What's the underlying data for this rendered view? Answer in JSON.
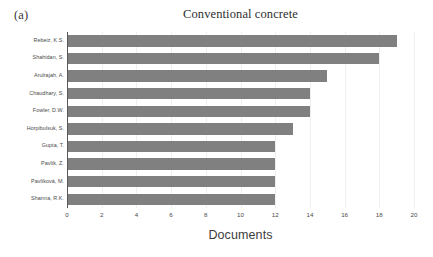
{
  "panel": {
    "letter": "(a)"
  },
  "chart_data": {
    "type": "bar",
    "orientation": "horizontal",
    "title": "Conventional concrete",
    "xlabel": "Documents",
    "ylabel": "",
    "categories": [
      "Rebeiz, K.S.",
      "Shahidan, S.",
      "Arulrajah, A.",
      "Chaudhary, S.",
      "Fowler, D.W.",
      "Horpibulsuk, S.",
      "Gupta, T.",
      "Pavlík, Z.",
      "Pavlíková, M.",
      "Sharma, R.K."
    ],
    "values": [
      19,
      18,
      15,
      14,
      14,
      13,
      12,
      12,
      12,
      12
    ],
    "xlim": [
      0,
      20
    ],
    "xticks": [
      0,
      2,
      4,
      6,
      8,
      10,
      12,
      14,
      16,
      18,
      20
    ],
    "xtick_labels": [
      "0",
      "2",
      "4",
      "6",
      "8",
      "10",
      "12",
      "14",
      "16",
      "18",
      "20"
    ],
    "grid": "vertical-light",
    "legend": "none",
    "bar_color": "#808080",
    "gridline_color": "#efefef",
    "axis_color": "#5a5a5a"
  }
}
